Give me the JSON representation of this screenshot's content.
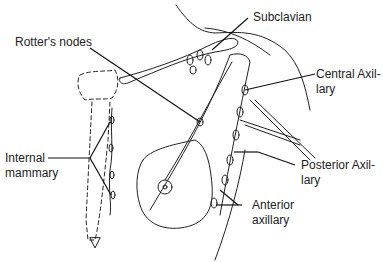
{
  "diagram": {
    "type": "anatomical illustration"
  },
  "labels": {
    "subclavian": "Subclavian",
    "rotters_nodes": "Rotter's nodes",
    "central_axillary_1": "Central Axil-",
    "central_axillary_2": "lary",
    "internal_mammary_1": "Internal",
    "internal_mammary_2": "mammary",
    "posterior_axillary_1": "Posterior Axil-",
    "posterior_axillary_2": "lary",
    "anterior_axillary_1": "Anterior",
    "anterior_axillary_2": "axillary"
  }
}
